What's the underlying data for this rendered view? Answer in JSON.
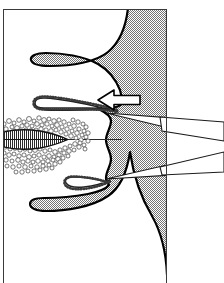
{
  "figure": {
    "domain": "Diagram",
    "kind": "line-drawing",
    "canvas": {
      "width": 224,
      "height": 283
    },
    "background_color": "#ffffff"
  },
  "frame": {
    "label": "figure-border",
    "x": 3,
    "y": 9,
    "width": 164,
    "height": 274,
    "stroke_color": "#3a3a3a",
    "stroke_width": 1,
    "fill_color": "#ffffff"
  },
  "tissue": {
    "label": "shaded-tissue-mass",
    "fill_color": "#9a9a9a",
    "pattern": "50-percent-checkerboard-dither",
    "pattern_light": "#ffffff",
    "pattern_dark": "#6e6e6e",
    "outline_color": "#000000",
    "outline_width": 2.2,
    "description": "Large dithered grey mass occupying the right half of the frame, with undulating villus-like projections on the upper and lower edges and three rounded scalloped lobes along the mid-right margin."
  },
  "crypt_upper": {
    "label": "upper-crypt-lumen",
    "description": "Elongated finger-shaped white lumen extending leftward from the tissue margin, bordered by a stippled brush-border edge.",
    "fill_color": "#ffffff",
    "edge_color": "#222222",
    "stipple_color": "#4a4a4a"
  },
  "crypt_lower": {
    "label": "lower-crypt-lumen",
    "description": "Short hooked white lumen opening leftward at the lower scalloped margin with a stippled epithelial lining.",
    "fill_color": "#ffffff",
    "edge_color": "#222222",
    "stipple_color": "#4a4a4a"
  },
  "secretion_cloud": {
    "label": "stippled-secretion-cloud",
    "description": "Irregular cloud of small open circles (mucus/secretion granules) surrounding a tapered hatched body on the left side of the figure.",
    "circle_outline_color": "#3b3b3b",
    "fill_color": "#ffffff",
    "count_approx": 210
  },
  "hatched_body": {
    "label": "hatched-tapered-body",
    "description": "Lens-shaped body with dense vertical hatching, blunt at the left and tapering to a point at the right where a thin duct line continues.",
    "outline_color": "#111111",
    "hatch_color": "#2b2b2b",
    "hatch_spacing_px": 2
  },
  "duct_line": {
    "label": "duct-channel-line",
    "description": "Thin horizontal line running from the tip of the hatched body rightward to the tissue margin.",
    "stroke_color": "#2a2a2a",
    "stroke_width": 1
  },
  "arrow": {
    "label": "block-arrow-pointing-left",
    "direction": "left",
    "fill_color": "#ffffff",
    "outline_color": "#000000",
    "outline_width": 1.6,
    "tip_x": 98,
    "tip_y": 100,
    "tail_x": 140
  },
  "leader_lines": [
    {
      "label": "upper-leader-line",
      "points_to": "upper-crypt-lumen-opening",
      "tip_x": 106,
      "tip_y": 113,
      "tail_x": 224,
      "tail_y_top": 122,
      "tail_y_bottom": 140,
      "fill_color": "#ffffff",
      "outline_color": "#1a1a1a"
    },
    {
      "label": "lower-leader-line",
      "points_to": "lower-crypt-lumen-opening",
      "tip_x": 106,
      "tip_y": 178,
      "tail_x": 224,
      "tail_y_top": 152,
      "tail_y_bottom": 172,
      "fill_color": "#ffffff",
      "outline_color": "#1a1a1a"
    }
  ],
  "legend": {
    "visible": false,
    "entries": []
  },
  "labels": {
    "visible_text": []
  }
}
